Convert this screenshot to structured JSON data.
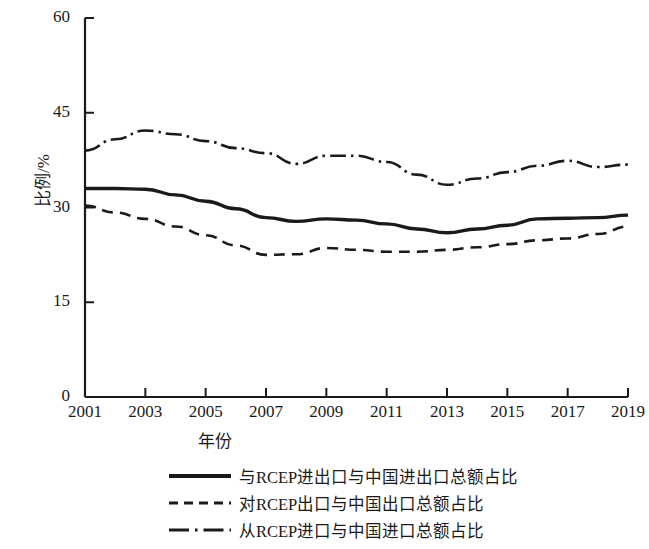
{
  "chart_data": {
    "type": "line",
    "title": "",
    "xlabel": "年份",
    "ylabel": "比例/%",
    "xlim": [
      2001,
      2019
    ],
    "ylim": [
      0,
      60
    ],
    "yticks": [
      0,
      15,
      30,
      45,
      60
    ],
    "xticks": [
      2001,
      2003,
      2005,
      2007,
      2009,
      2011,
      2013,
      2015,
      2017,
      2019
    ],
    "x": [
      2001,
      2002,
      2003,
      2004,
      2005,
      2006,
      2007,
      2008,
      2009,
      2010,
      2011,
      2012,
      2013,
      2014,
      2015,
      2016,
      2017,
      2018,
      2019
    ],
    "grid": false,
    "legend_position": "below-center",
    "series": [
      {
        "name": "与RCEP进出口与中国进出口总额占比",
        "style": "solid",
        "color": "#1a1a1a",
        "values": [
          33.0,
          33.0,
          32.9,
          32.0,
          31.0,
          29.8,
          28.4,
          27.8,
          28.2,
          28.0,
          27.4,
          26.6,
          26.0,
          26.6,
          27.2,
          28.2,
          28.3,
          28.4,
          28.8
        ]
      },
      {
        "name": "对RCEP出口与中国出口总额占比",
        "style": "dashed",
        "color": "#1a1a1a",
        "values": [
          30.3,
          29.2,
          28.2,
          27.0,
          25.6,
          24.0,
          22.5,
          22.6,
          23.6,
          23.3,
          23.0,
          23.0,
          23.3,
          23.7,
          24.2,
          24.8,
          25.1,
          25.8,
          27.0
        ]
      },
      {
        "name": "从RCEP进口与中国进口总额占比",
        "style": "dashdot",
        "color": "#1a1a1a",
        "values": [
          39.0,
          40.8,
          42.2,
          41.6,
          40.5,
          39.4,
          38.6,
          36.9,
          38.2,
          38.2,
          37.2,
          35.2,
          33.6,
          34.6,
          35.6,
          36.6,
          37.4,
          36.4,
          36.8
        ]
      }
    ]
  },
  "axis": {
    "ylabel": "比例/%",
    "xlabel": "年份",
    "ytick_labels": [
      "60",
      "45",
      "30",
      "15",
      "0"
    ],
    "xtick_labels": [
      "2001",
      "2003",
      "2005",
      "2007",
      "2009",
      "2011",
      "2013",
      "2015",
      "2017",
      "2019"
    ]
  },
  "legend": {
    "items": [
      {
        "label": "与RCEP进出口与中国进出口总额占比",
        "style": "solid"
      },
      {
        "label": "对RCEP出口与中国出口总额占比",
        "style": "dashed"
      },
      {
        "label": "从RCEP进口与中国进口总额占比",
        "style": "dashdot"
      }
    ]
  }
}
